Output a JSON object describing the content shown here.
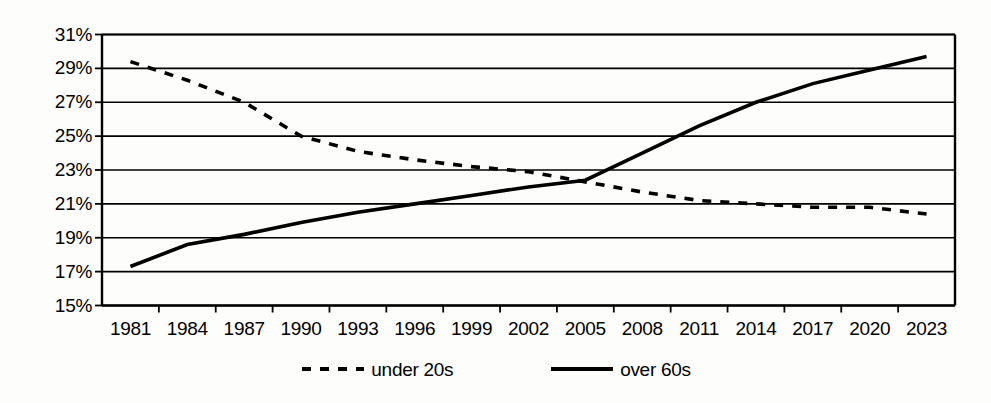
{
  "chart_data": {
    "type": "line",
    "title": "",
    "subtitle": "",
    "xlabel": "",
    "ylabel": "",
    "categories": [
      "1981",
      "1984",
      "1987",
      "1990",
      "1993",
      "1996",
      "1999",
      "2002",
      "2005",
      "2008",
      "2011",
      "2014",
      "2017",
      "2020",
      "2023"
    ],
    "ytick_labels": [
      "31%",
      "29%",
      "27%",
      "25%",
      "23%",
      "21%",
      "19%",
      "17%",
      "15%"
    ],
    "ytick_values": [
      31,
      29,
      27,
      25,
      23,
      21,
      19,
      17,
      15
    ],
    "ylim": [
      15,
      31
    ],
    "ystep": 2,
    "grid": "horizontal",
    "legend_position": "bottom-center",
    "series": [
      {
        "name": "under 20s",
        "style": "dashed",
        "color": "#000000",
        "values": [
          29.4,
          28.3,
          27.0,
          25.0,
          24.1,
          23.6,
          23.2,
          22.9,
          22.3,
          21.7,
          21.2,
          21.0,
          20.8,
          20.8,
          20.4
        ]
      },
      {
        "name": "over 60s",
        "style": "solid",
        "color": "#000000",
        "values": [
          17.3,
          18.6,
          19.2,
          19.9,
          20.5,
          21.0,
          21.5,
          22.0,
          22.4,
          24.0,
          25.6,
          27.0,
          28.1,
          28.9,
          29.7
        ]
      }
    ],
    "annotations": []
  },
  "legend": {
    "entries": [
      {
        "label": "under 20s",
        "swatch": "dashed-line-swatch"
      },
      {
        "label": "over 60s",
        "swatch": "solid-line-swatch"
      }
    ]
  },
  "colors": {
    "line": "#000000",
    "axis": "#000000",
    "grid": "#000000",
    "background": "#fdfdfc"
  }
}
